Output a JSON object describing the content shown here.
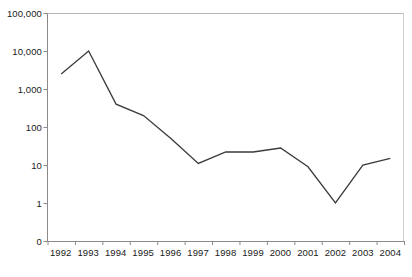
{
  "chart_data": {
    "type": "line",
    "title": "",
    "subtitle": "",
    "xlabel": "",
    "ylabel": "",
    "categories": [
      "1992",
      "1993",
      "1994",
      "1995",
      "1996",
      "1997",
      "1998",
      "1999",
      "2000",
      "2001",
      "2002",
      "2003",
      "2004"
    ],
    "series": [
      {
        "name": "",
        "values": [
          2500,
          10000,
          400,
          200,
          50,
          11,
          22,
          22,
          28,
          9,
          1,
          10,
          15
        ]
      }
    ],
    "yscale": "log",
    "ytick_labels": [
      "100,000",
      "10,000",
      "1,000",
      "100",
      "10",
      "1",
      "0"
    ],
    "ytick_values": [
      100000,
      10000,
      1000,
      100,
      10,
      1,
      0
    ],
    "ylim": [
      0,
      100000
    ],
    "grid": false,
    "legend": "none",
    "line_color": "#3b3b3b",
    "axis_color": "#8a8a8a",
    "text_color": "#1a1a1a"
  }
}
